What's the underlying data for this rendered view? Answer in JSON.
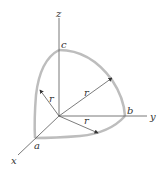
{
  "diagram": {
    "type": "octant-of-sphere",
    "axes": {
      "x": "x",
      "y": "y",
      "z": "z"
    },
    "points": {
      "a": "a",
      "b": "b",
      "c": "c"
    },
    "radius_label": "r",
    "colors": {
      "outline": "#bbbbbb",
      "line": "#444444",
      "text": "#333333"
    }
  }
}
